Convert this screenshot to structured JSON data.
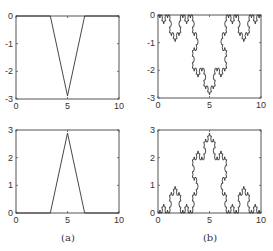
{
  "figure": {
    "captions": [
      "(a)",
      "(b)"
    ]
  },
  "chart_data": [
    {
      "type": "line",
      "panel": "a-top",
      "title": "",
      "xlabel": "",
      "ylabel": "",
      "xlim": [
        0,
        10
      ],
      "ylim": [
        -3,
        0
      ],
      "xticks": [
        "0",
        "5",
        "10"
      ],
      "yticks": [
        "0",
        "-1",
        "-2",
        "-3"
      ],
      "grid": false,
      "series": [
        {
          "name": "generator (downward)",
          "x": [
            0,
            3.333,
            5,
            6.667,
            10
          ],
          "y": [
            0,
            0,
            -2.887,
            0,
            0
          ]
        }
      ]
    },
    {
      "type": "line",
      "panel": "b-top",
      "title": "",
      "xlim": [
        0,
        10
      ],
      "ylim": [
        -3,
        0
      ],
      "xticks": [
        "0",
        "5",
        "10"
      ],
      "yticks": [
        "0",
        "-1",
        "-2",
        "-3"
      ],
      "grid": false,
      "series": [
        {
          "name": "Koch curve (downward), 4 iterations",
          "generator": "koch",
          "iterations": 4,
          "direction": -1,
          "start": [
            0,
            0
          ],
          "end": [
            10,
            0
          ]
        }
      ]
    },
    {
      "type": "line",
      "panel": "a-bottom",
      "title": "",
      "xlim": [
        0,
        10
      ],
      "ylim": [
        0,
        3
      ],
      "xticks": [
        "0",
        "5",
        "10"
      ],
      "yticks": [
        "0",
        "1",
        "2",
        "3"
      ],
      "grid": false,
      "series": [
        {
          "name": "generator (upward)",
          "x": [
            0,
            3.333,
            5,
            6.667,
            10
          ],
          "y": [
            0,
            0,
            2.887,
            0,
            0
          ]
        }
      ]
    },
    {
      "type": "line",
      "panel": "b-bottom",
      "title": "",
      "xlim": [
        0,
        10
      ],
      "ylim": [
        0,
        3
      ],
      "xticks": [
        "0",
        "5",
        "10"
      ],
      "yticks": [
        "0",
        "1",
        "2",
        "3"
      ],
      "grid": false,
      "series": [
        {
          "name": "Koch curve (upward), 4 iterations",
          "generator": "koch",
          "iterations": 4,
          "direction": 1,
          "start": [
            0,
            0
          ],
          "end": [
            10,
            0
          ]
        }
      ]
    }
  ],
  "layout": {
    "panels": [
      {
        "left": 16,
        "top": 16,
        "right": 119,
        "bottom": 99
      },
      {
        "left": 158,
        "top": 15,
        "right": 261,
        "bottom": 98
      },
      {
        "left": 16,
        "top": 130,
        "right": 119,
        "bottom": 213
      },
      {
        "left": 158,
        "top": 130,
        "right": 261,
        "bottom": 213
      }
    ],
    "caption_pos": [
      {
        "x": 68,
        "y": 241
      },
      {
        "x": 210,
        "y": 241
      }
    ],
    "line_color": "#333333",
    "axis_color": "#555555"
  }
}
